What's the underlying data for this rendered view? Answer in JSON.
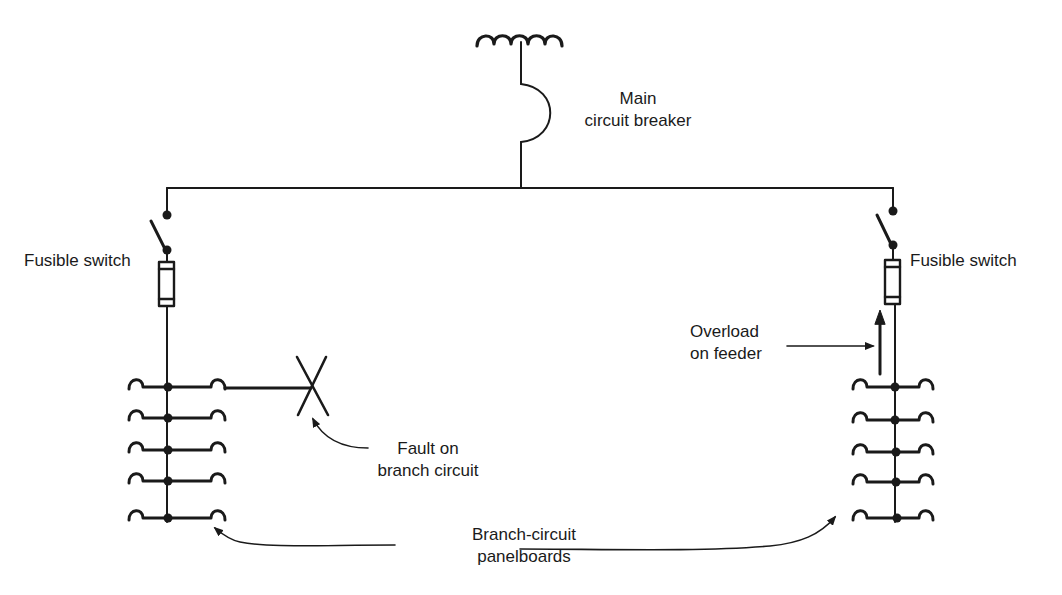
{
  "diagram": {
    "colors": {
      "ink": "#1a1a1a",
      "background": "#ffffff"
    },
    "labels": {
      "main_breaker": [
        "Main",
        "circuit breaker"
      ],
      "fusible_switch_left": "Fusible switch",
      "fusible_switch_right": "Fusible switch",
      "overload": [
        "Overload",
        "on feeder"
      ],
      "fault": [
        "Fault on",
        "branch circuit"
      ],
      "panelboards": [
        "Branch-circuit",
        "panelboards"
      ]
    },
    "components": [
      {
        "id": "transformer",
        "type": "transformer-coil",
        "turns": 5
      },
      {
        "id": "main-breaker",
        "type": "circuit-breaker"
      },
      {
        "id": "bus",
        "type": "horizontal-bus"
      },
      {
        "id": "fusible-switch-left",
        "type": "switch-with-fuse"
      },
      {
        "id": "fusible-switch-right",
        "type": "switch-with-fuse"
      },
      {
        "id": "panelboard-left",
        "type": "branch-panelboard",
        "branches": 5
      },
      {
        "id": "panelboard-right",
        "type": "branch-panelboard",
        "branches": 5
      },
      {
        "id": "fault-marker",
        "type": "x-mark",
        "on": "panelboard-left branch 1"
      },
      {
        "id": "overload-arrow",
        "type": "current-arrow",
        "on": "right feeder"
      }
    ]
  }
}
